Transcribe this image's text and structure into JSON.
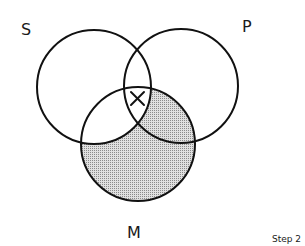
{
  "diagram": {
    "type": "venn-3",
    "sets": [
      {
        "id": "S",
        "label": "S"
      },
      {
        "id": "P",
        "label": "P"
      },
      {
        "id": "M",
        "label": "M"
      }
    ],
    "shaded_regions": [
      "M-only",
      "M∩P (not S)"
    ],
    "marked_region": {
      "region": "S∩P (within/adjacent to M boundary)",
      "mark": "X"
    },
    "caption": "Step 2"
  },
  "colors": {
    "stroke": "#111111",
    "shading": "#b8b8b8"
  }
}
